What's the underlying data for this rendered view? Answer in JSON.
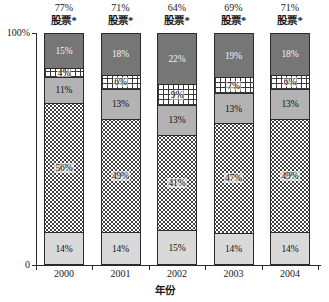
{
  "chart_data": {
    "type": "bar",
    "title": "",
    "subtitle": "",
    "xlabel": "年份",
    "ylabel": "",
    "ylim": [
      0,
      100
    ],
    "grid": false,
    "legend_position": "none",
    "stacked": true,
    "categories": [
      "2000",
      "2001",
      "2002",
      "2003",
      "2004"
    ],
    "y_ticks": [
      "100%",
      "0"
    ],
    "series": [
      {
        "name": "seg-bottom-light-gray",
        "pattern": "solid-light-gray",
        "values": [
          14,
          14,
          15,
          14,
          14
        ],
        "labels": [
          "14%",
          "14%",
          "15%",
          "14%",
          "14%"
        ]
      },
      {
        "name": "seg-dotted",
        "pattern": "dotted",
        "values": [
          56,
          49,
          41,
          47,
          49
        ],
        "labels": [
          "56%",
          "49%",
          "41%",
          "47%",
          "49%"
        ]
      },
      {
        "name": "seg-mid-gray",
        "pattern": "solid-mid-gray",
        "values": [
          11,
          13,
          13,
          13,
          13
        ],
        "labels": [
          "11%",
          "13%",
          "13%",
          "13%",
          "13%"
        ]
      },
      {
        "name": "seg-grid",
        "pattern": "crosshatch-grid",
        "values": [
          4,
          6,
          9,
          7,
          6
        ],
        "labels": [
          "4%",
          "6%",
          "9%",
          "7%",
          "6%"
        ]
      },
      {
        "name": "seg-top-dark-gray",
        "pattern": "solid-dark-gray",
        "values": [
          15,
          18,
          22,
          19,
          18
        ],
        "labels": [
          "15%",
          "18%",
          "22%",
          "19%",
          "18%"
        ]
      }
    ],
    "annotations": [
      {
        "percent": "77%",
        "name": "股票*"
      },
      {
        "percent": "71%",
        "name": "股票*"
      },
      {
        "percent": "64%",
        "name": "股票*"
      },
      {
        "percent": "69%",
        "name": "股票*"
      },
      {
        "percent": "71%",
        "name": "股票*"
      }
    ],
    "colors": {
      "dark_gray": "#767676",
      "mid_gray": "#b3b3b3",
      "light_gray": "#d9d9d9",
      "grid_white": "#ffffff",
      "dot_white": "#ffffff",
      "axis": "#2b2b2b"
    }
  },
  "axis": {
    "y_top_label": "100%",
    "y_bottom_label": "0",
    "x_title": "年份"
  },
  "bars": [
    {
      "category": "2000",
      "annotation_percent": "77%",
      "annotation_name": "股票*",
      "segments": [
        {
          "label": "15%",
          "value": 15,
          "style": "dark"
        },
        {
          "label": "4%",
          "value": 4,
          "style": "grid"
        },
        {
          "label": "11%",
          "value": 11,
          "style": "mid"
        },
        {
          "label": "56%",
          "value": 56,
          "style": "dot"
        },
        {
          "label": "14%",
          "value": 14,
          "style": "light"
        }
      ]
    },
    {
      "category": "2001",
      "annotation_percent": "71%",
      "annotation_name": "股票*",
      "segments": [
        {
          "label": "18%",
          "value": 18,
          "style": "dark"
        },
        {
          "label": "6%",
          "value": 6,
          "style": "grid"
        },
        {
          "label": "13%",
          "value": 13,
          "style": "mid"
        },
        {
          "label": "49%",
          "value": 49,
          "style": "dot"
        },
        {
          "label": "14%",
          "value": 14,
          "style": "light"
        }
      ]
    },
    {
      "category": "2002",
      "annotation_percent": "64%",
      "annotation_name": "股票*",
      "segments": [
        {
          "label": "22%",
          "value": 22,
          "style": "dark"
        },
        {
          "label": "9%",
          "value": 9,
          "style": "grid"
        },
        {
          "label": "13%",
          "value": 13,
          "style": "mid"
        },
        {
          "label": "41%",
          "value": 41,
          "style": "dot"
        },
        {
          "label": "15%",
          "value": 15,
          "style": "light"
        }
      ]
    },
    {
      "category": "2003",
      "annotation_percent": "69%",
      "annotation_name": "股票*",
      "segments": [
        {
          "label": "19%",
          "value": 19,
          "style": "dark"
        },
        {
          "label": "7%",
          "value": 7,
          "style": "grid"
        },
        {
          "label": "13%",
          "value": 13,
          "style": "mid"
        },
        {
          "label": "47%",
          "value": 47,
          "style": "dot"
        },
        {
          "label": "14%",
          "value": 14,
          "style": "light"
        }
      ]
    },
    {
      "category": "2004",
      "annotation_percent": "71%",
      "annotation_name": "股票*",
      "segments": [
        {
          "label": "18%",
          "value": 18,
          "style": "dark"
        },
        {
          "label": "6%",
          "value": 6,
          "style": "grid"
        },
        {
          "label": "13%",
          "value": 13,
          "style": "mid"
        },
        {
          "label": "49%",
          "value": 49,
          "style": "dot"
        },
        {
          "label": "14%",
          "value": 14,
          "style": "light"
        }
      ]
    }
  ]
}
